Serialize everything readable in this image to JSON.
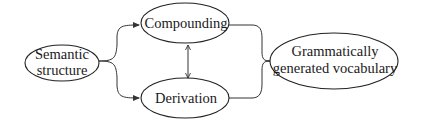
{
  "diagram": {
    "nodes": [
      {
        "id": "semantic",
        "lines": [
          "Semantic",
          "structure"
        ]
      },
      {
        "id": "compounding",
        "lines": [
          "Compounding"
        ]
      },
      {
        "id": "derivation",
        "lines": [
          "Derivation"
        ]
      },
      {
        "id": "vocabulary",
        "lines": [
          "Grammatically",
          "generated vocabulary"
        ]
      }
    ],
    "edges": [
      {
        "from": "semantic",
        "to": "compounding",
        "type": "arrow"
      },
      {
        "from": "semantic",
        "to": "derivation",
        "type": "arrow"
      },
      {
        "from": "compounding",
        "to": "derivation",
        "type": "double-arrow"
      },
      {
        "from": "compounding",
        "to": "vocabulary",
        "type": "arrow"
      },
      {
        "from": "derivation",
        "to": "vocabulary",
        "type": "arrow"
      }
    ]
  }
}
